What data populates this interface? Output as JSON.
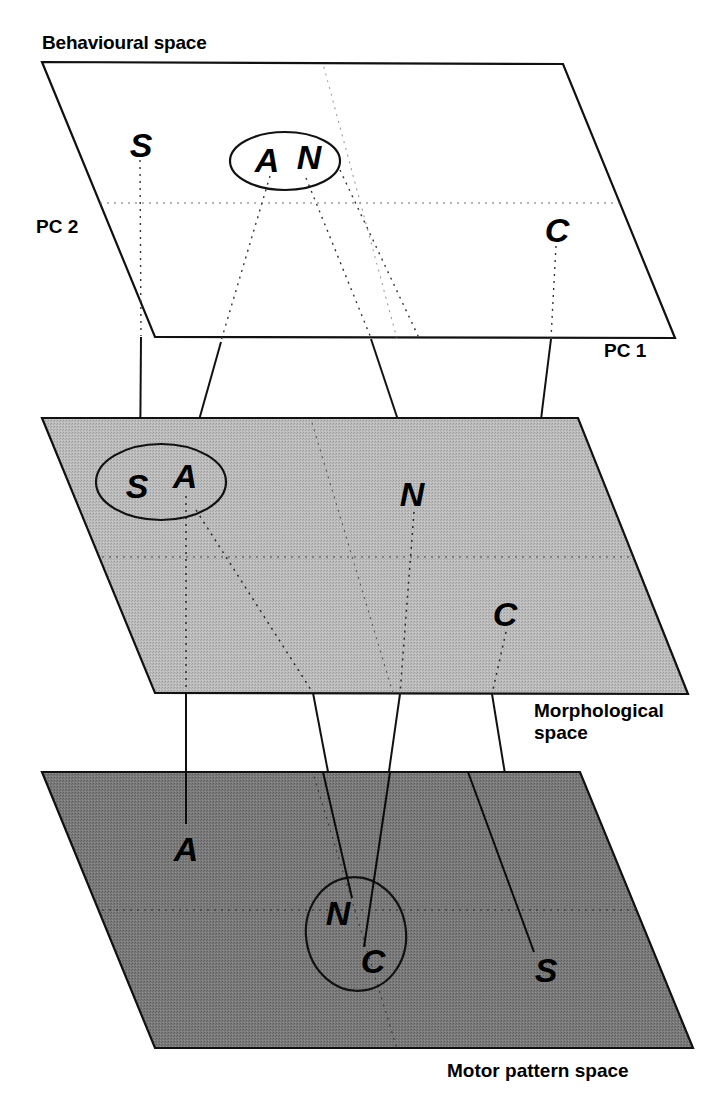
{
  "figure": {
    "background_color": "#ffffff",
    "ink_color": "#000000"
  },
  "planes": [
    {
      "id": "behavioural",
      "label": "Behavioural space",
      "label_position": "top-left",
      "fill": "#ffffff",
      "fill_name": "white",
      "axis_labels": {
        "y": "PC 2",
        "x": "PC 1"
      },
      "points": [
        {
          "id": "S",
          "label": "S",
          "grouped": false
        },
        {
          "id": "A",
          "label": "A",
          "grouped": true
        },
        {
          "id": "N",
          "label": "N",
          "grouped": true
        },
        {
          "id": "C",
          "label": "C",
          "grouped": false
        }
      ],
      "cluster": {
        "members": [
          "A",
          "N"
        ],
        "shape": "ellipse"
      }
    },
    {
      "id": "morphological",
      "label": "Morphological space",
      "label_line_1": "Morphological",
      "label_line_2": "space",
      "label_position": "bottom-right",
      "fill": "#b4b4b4",
      "fill_name": "light gray",
      "points": [
        {
          "id": "S",
          "label": "S",
          "grouped": true
        },
        {
          "id": "A",
          "label": "A",
          "grouped": true
        },
        {
          "id": "N",
          "label": "N",
          "grouped": false
        },
        {
          "id": "C",
          "label": "C",
          "grouped": false
        }
      ],
      "cluster": {
        "members": [
          "S",
          "A"
        ],
        "shape": "ellipse"
      }
    },
    {
      "id": "motor-pattern",
      "label": "Motor pattern space",
      "label_position": "bottom-right",
      "fill": "#767676",
      "fill_name": "dark gray",
      "points": [
        {
          "id": "A",
          "label": "A",
          "grouped": false
        },
        {
          "id": "N",
          "label": "N",
          "grouped": true
        },
        {
          "id": "C",
          "label": "C",
          "grouped": true
        },
        {
          "id": "S",
          "label": "S",
          "grouped": false
        }
      ],
      "cluster": {
        "members": [
          "N",
          "C"
        ],
        "shape": "ellipse"
      }
    }
  ],
  "species_keys": [
    "S",
    "A",
    "N",
    "C"
  ],
  "connectors": {
    "style": "solid thin lines",
    "description": "Each species letter is joined by a line from its position on one plane to its position on the plane below",
    "top_to_middle": [
      "S",
      "A",
      "N",
      "C"
    ],
    "middle_to_bottom": [
      "A",
      "N",
      "C",
      "S"
    ]
  },
  "gridlines": {
    "style": "dotted",
    "description": "faint dotted PC axes drawn within each plane"
  }
}
